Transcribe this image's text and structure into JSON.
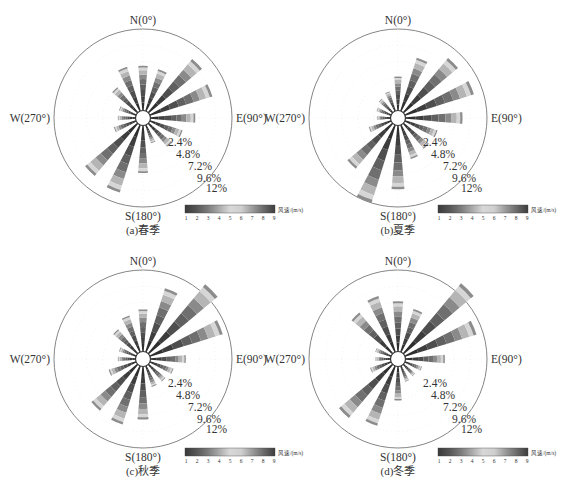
{
  "figure": {
    "colorbar": {
      "label": "风速/(m/s)",
      "ticks": [
        "1",
        "2",
        "3",
        "4",
        "5",
        "6",
        "7",
        "8",
        "9"
      ],
      "stops": [
        "#3a3a3a",
        "#555555",
        "#7a7a7a",
        "#a8a8a8",
        "#d8d8d8",
        "#cfcfcf",
        "#9a9a9a",
        "#6a6a6a",
        "#3d3d3d"
      ]
    },
    "direction_labels": {
      "n": "N(0°)",
      "e": "E(90°)",
      "s": "S(180°)",
      "w": "W(270°)"
    },
    "ring_labels": [
      "2.4%",
      "4.8%",
      "7.2%",
      "9.6%",
      "12%"
    ]
  },
  "chart_data": [
    {
      "type": "wind-rose",
      "title": "(a)春季",
      "directions_deg": [
        0,
        22.5,
        45,
        67.5,
        90,
        112.5,
        135,
        157.5,
        180,
        202.5,
        225,
        247.5,
        270,
        292.5,
        315,
        337.5
      ],
      "frequency_pct": [
        6.6,
        6.4,
        10.2,
        9.6,
        6.6,
        5.0,
        4.4,
        2.8,
        7.0,
        10.4,
        10.0,
        3.4,
        2.6,
        2.6,
        4.8,
        6.8
      ],
      "rings_pct": [
        2.4,
        4.8,
        7.2,
        9.6,
        12
      ],
      "legend": "风速/(m/s)",
      "speed_range": [
        1,
        9
      ]
    },
    {
      "type": "wind-rose",
      "title": "(b)夏季",
      "directions_deg": [
        0,
        22.5,
        45,
        67.5,
        90,
        112.5,
        135,
        157.5,
        180,
        202.5,
        225,
        247.5,
        270,
        292.5,
        315,
        337.5
      ],
      "frequency_pct": [
        5.0,
        8.2,
        10.4,
        10.6,
        8.4,
        5.0,
        4.8,
        5.2,
        9.4,
        12.0,
        8.6,
        3.4,
        2.0,
        2.2,
        2.6,
        3.0
      ],
      "rings_pct": [
        2.4,
        4.8,
        7.2,
        9.6,
        12
      ],
      "legend": "风速/(m/s)",
      "speed_range": [
        1,
        9
      ]
    },
    {
      "type": "wind-rose",
      "title": "(c)秋季",
      "directions_deg": [
        0,
        22.5,
        45,
        67.5,
        90,
        112.5,
        135,
        157.5,
        180,
        202.5,
        225,
        247.5,
        270,
        292.5,
        315,
        337.5
      ],
      "frequency_pct": [
        6.2,
        9.8,
        13.2,
        11.2,
        5.2,
        3.6,
        3.2,
        3.2,
        7.8,
        9.0,
        8.8,
        4.2,
        2.6,
        2.6,
        4.6,
        5.6
      ],
      "rings_pct": [
        2.4,
        4.8,
        7.2,
        9.6,
        12
      ],
      "legend": "风速/(m/s)",
      "speed_range": [
        1,
        9
      ]
    },
    {
      "type": "wind-rose",
      "title": "(d)冬季",
      "directions_deg": [
        0,
        22.5,
        45,
        67.5,
        90,
        112.5,
        135,
        157.5,
        180,
        202.5,
        225,
        247.5,
        270,
        292.5,
        315,
        337.5
      ],
      "frequency_pct": [
        7.4,
        6.6,
        13.4,
        11.0,
        5.8,
        2.6,
        2.2,
        2.4,
        5.0,
        9.2,
        10.2,
        3.2,
        2.2,
        2.4,
        7.8,
        8.6
      ],
      "rings_pct": [
        2.4,
        4.8,
        7.2,
        9.6,
        12
      ],
      "legend": "风速/(m/s)",
      "speed_range": [
        1,
        9
      ]
    }
  ]
}
